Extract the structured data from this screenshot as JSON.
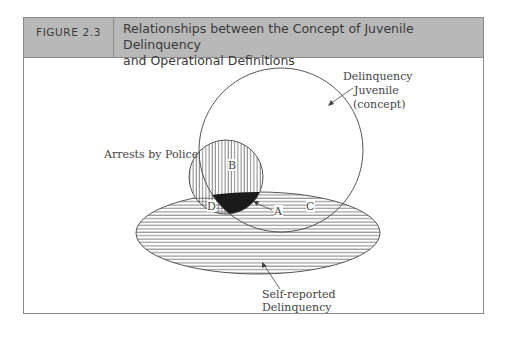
{
  "figure": {
    "label": "FIGURE 2.3",
    "title_line1": "Relationships between the Concept of Juvenile Delinquency",
    "title_line2": "and Operational Definitions"
  },
  "diagram": {
    "juvenile_label_line1": "Delinquency",
    "juvenile_label_line2": "Juvenile",
    "juvenile_label_line3": "(concept)",
    "arrests_label": "Arrests by Police",
    "self_report_line1": "Self-reported",
    "self_report_line2": "Delinquency",
    "region_a": "A",
    "region_b": "B",
    "region_c": "C",
    "region_d": "D",
    "colors": {
      "header_bg": "#b8b8b8",
      "stroke": "#444444",
      "fill_a": "#1a1a1a"
    }
  }
}
